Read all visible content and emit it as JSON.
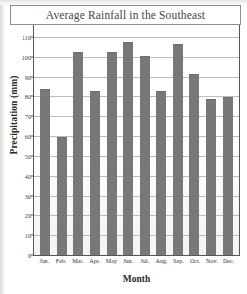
{
  "chart_data": {
    "type": "bar",
    "title": "Average Rainfall in the Southeast",
    "xlabel": "Month",
    "ylabel": "Precipitation (mm)",
    "categories": [
      "Jan.",
      "Feb.",
      "Mar.",
      "Apr.",
      "May",
      "Jun.",
      "Jul.",
      "Aug.",
      "Sep.",
      "Oct.",
      "Nov.",
      "Dec."
    ],
    "values": [
      83,
      59,
      102,
      82,
      102,
      107,
      100,
      82,
      106,
      91,
      78,
      79
    ],
    "ylim": [
      0,
      120
    ],
    "ytick_labels": [
      "0",
      "10",
      "20",
      "30",
      "40",
      "50",
      "60",
      "70",
      "80",
      "90",
      "100",
      "110",
      "120"
    ],
    "ytick_values": [
      0,
      10,
      20,
      30,
      40,
      50,
      60,
      70,
      80,
      90,
      100,
      110,
      120
    ],
    "grid": true,
    "legend": "none",
    "bar_color": "#787878",
    "grid_color": "#b9bcc0",
    "axis_color": "#55565a"
  }
}
